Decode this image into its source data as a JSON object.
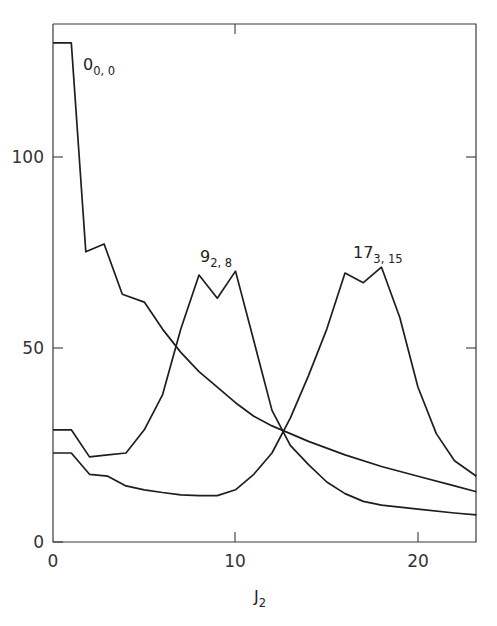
{
  "chart_data": {
    "type": "line",
    "title": "",
    "xlabel": "J2",
    "ylabel": "",
    "xlim": [
      0,
      23.2
    ],
    "ylim": [
      0,
      132
    ],
    "grid": false,
    "legend": "none (curves labelled inline)",
    "x_ticks": [
      0,
      10,
      20
    ],
    "y_ticks": [
      0,
      50,
      100
    ],
    "series": [
      {
        "name": "0_{0,0}",
        "label_main": "0",
        "label_sub": "0, 0",
        "x": [
          0,
          1,
          1.8,
          2.8,
          3.8,
          5,
          6,
          7,
          8,
          9,
          10,
          11,
          12,
          13,
          14,
          16,
          18,
          20,
          22,
          23.2
        ],
        "y": [
          129,
          129,
          75,
          77,
          64,
          62,
          55,
          49,
          44,
          40,
          36,
          32.5,
          30,
          28,
          26,
          22.5,
          19.5,
          17,
          14.5,
          13
        ]
      },
      {
        "name": "9_{2,8}",
        "label_main": "9",
        "label_sub": "2, 8",
        "x": [
          0,
          1,
          2,
          3,
          4,
          5,
          6,
          7,
          8,
          9,
          10,
          11,
          12,
          13,
          14,
          15,
          16,
          17,
          18,
          20,
          22,
          23.2
        ],
        "y": [
          29,
          29,
          22,
          22.5,
          23,
          29,
          38,
          55,
          69,
          63,
          70,
          52,
          34,
          25,
          20,
          15.5,
          12.5,
          10.5,
          9.5,
          8.5,
          7.5,
          7
        ]
      },
      {
        "name": "17_{3,15}",
        "label_main": "17",
        "label_sub": "3, 15",
        "x": [
          0,
          1,
          2,
          3,
          4,
          5,
          6,
          7,
          8,
          9,
          10,
          11,
          12,
          13,
          14,
          15,
          16,
          17,
          18,
          19,
          20,
          21,
          22,
          23.2
        ],
        "y": [
          23,
          23,
          17.5,
          17,
          14.5,
          13.5,
          12.8,
          12.2,
          12,
          12,
          13.5,
          17.5,
          23,
          32,
          43,
          55,
          69.5,
          67,
          71,
          58,
          40,
          28,
          21,
          17
        ]
      }
    ]
  },
  "axes": {
    "xlabel_main": "J",
    "xlabel_sub": "2",
    "x_tick_labels": [
      "0",
      "10",
      "20"
    ],
    "y_tick_labels": [
      "0",
      "50",
      "100"
    ]
  }
}
